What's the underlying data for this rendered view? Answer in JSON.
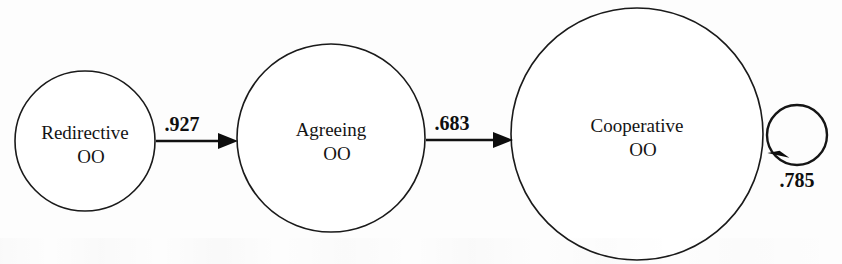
{
  "diagram": {
    "type": "state-transition-diagram",
    "title": "",
    "canvas": {
      "width": 842,
      "height": 264
    },
    "stroke_color": "#141414",
    "background_color": "#fdfdfd",
    "nodes": [
      {
        "id": "redirective",
        "label": "Redirective",
        "sublabel": "OO",
        "cx": 85,
        "cy": 141,
        "r": 70
      },
      {
        "id": "agreeing",
        "label": "Agreeing",
        "sublabel": "OO",
        "cx": 331,
        "cy": 138,
        "r": 94
      },
      {
        "id": "cooperative",
        "label": "Cooperative",
        "sublabel": "OO",
        "cx": 637,
        "cy": 134,
        "r": 126
      }
    ],
    "edges": [
      {
        "id": "redirective-to-agreeing",
        "from": "redirective",
        "to": "agreeing",
        "label": ".927",
        "value": 0.927,
        "x1": 156,
        "x2": 238,
        "y": 141,
        "label_x": 182,
        "label_y": 131
      },
      {
        "id": "agreeing-to-cooperative",
        "from": "agreeing",
        "to": "cooperative",
        "label": ".683",
        "value": 0.683,
        "x1": 426,
        "x2": 513,
        "y": 140,
        "label_x": 452,
        "label_y": 130
      }
    ],
    "self_loops": [
      {
        "id": "cooperative-self-loop",
        "node": "cooperative",
        "label": ".785",
        "value": 0.785,
        "cx": 797,
        "cy": 135,
        "r": 30,
        "label_x": 797,
        "label_y": 187
      }
    ]
  }
}
